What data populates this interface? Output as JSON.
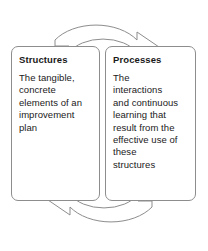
{
  "diagram": {
    "type": "cycle-diagram",
    "boxes": [
      {
        "id": "structures",
        "title": "Structures",
        "body": "The tangible,\nconcrete\nelements of an\nimprovement\nplan"
      },
      {
        "id": "processes",
        "title": "Processes",
        "body": "The\ninteractions\nand continuous\nlearning that\nresult from the\neffective use of\nthese\nstructures"
      }
    ],
    "arrows": [
      {
        "id": "top-arrow",
        "label": "structures-to-processes",
        "direction": "left-to-right"
      },
      {
        "id": "bottom-arrow",
        "label": "processes-to-structures",
        "direction": "right-to-left"
      }
    ],
    "colors": {
      "outline": "#8d8d8d",
      "text": "#1a1a1a",
      "background": "#ffffff"
    }
  }
}
